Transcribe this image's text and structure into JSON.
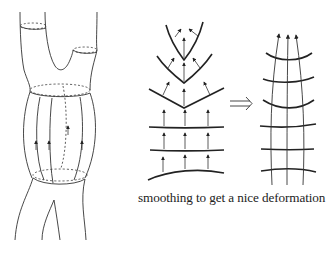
{
  "figure": {
    "left_panel": {
      "description": "Tube-shaped cobordism with branching top and legs; vertical flow lines with arrows on the middle cylinder",
      "flow_arrows": 4
    },
    "middle_panel": {
      "description": "Level curves with normal arrows forming cusps (V shapes) near top",
      "levels": 6
    },
    "implies_symbol": "⟹",
    "right_panel": {
      "description": "Smoothed level curves crossed by three upward flow lines",
      "levels": 6,
      "flow_lines": 3
    },
    "caption": "smoothing to get a nice deformation"
  },
  "colors": {
    "line": "#222222",
    "background": "#ffffff"
  }
}
